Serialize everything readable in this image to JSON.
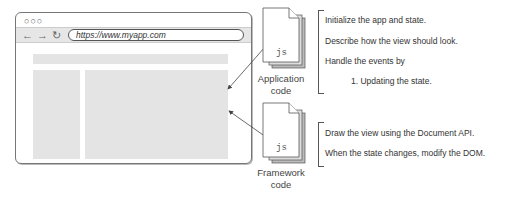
{
  "browser": {
    "window_controls": "○○○",
    "nav": {
      "back_icon": "←",
      "forward_icon": "→",
      "reload_icon": "↻"
    },
    "url": "https://www.myapp.com"
  },
  "files": [
    {
      "ext": "js",
      "label_line1": "Application",
      "label_line2": "code"
    },
    {
      "ext": "js",
      "label_line1": "Framework",
      "label_line2": "code"
    }
  ],
  "application_notes": [
    "Initialize the app and state.",
    "Describe how the view should look.",
    "Handle the events by",
    "1. Updating the state."
  ],
  "framework_notes": [
    "Draw the view using the Document API.",
    "When the state changes, modify the DOM."
  ]
}
